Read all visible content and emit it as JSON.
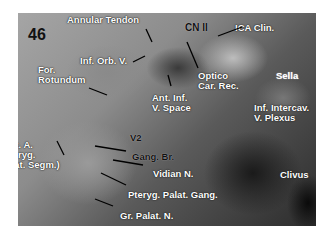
{
  "figure_number": "46",
  "labels": {
    "annular_tendon": "Annular Tendon",
    "inf_orb_v": "Inf. Orb. V.",
    "for_rotundum": "For.\nRotundum",
    "cn_ii": "CN II",
    "ica_clin": "ICA Clin.",
    "optico_car_rec": "Optico\nCar. Rec.",
    "sella": "Sella",
    "ant_inf_v_space": "Ant. Inf.\nV. Space",
    "inf_intercav_v_plexus": "Inf. Intercav.\nV. Plexus",
    "v2": "V2",
    "max_a": "Max. A.\n(Pteryg.\nPalat. Segm.)",
    "gang_br": "Gang. Br.",
    "vidian_n": "Vidian N.",
    "clivus": "Clivus",
    "pteryg_palat_gang": "Pteryg. Palat. Gang.",
    "gr_palat_n": "Gr. Palat. N."
  }
}
